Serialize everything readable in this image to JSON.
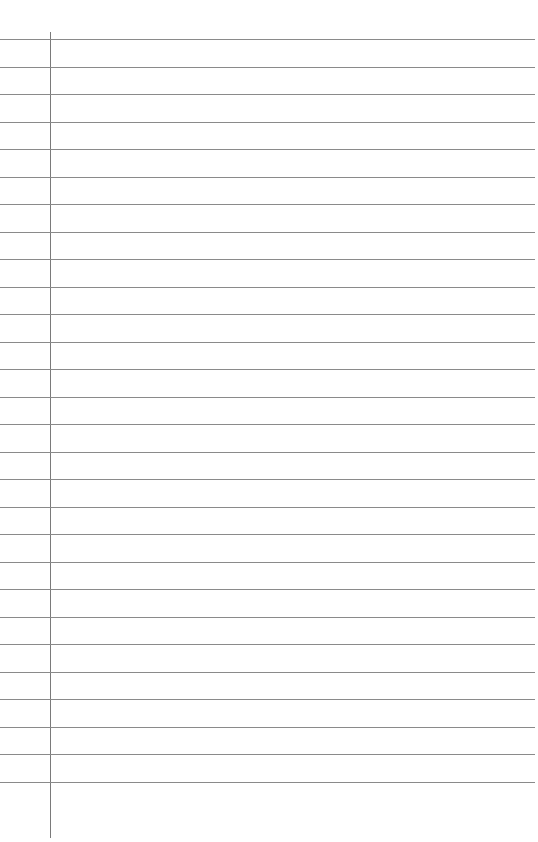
{
  "page": {
    "type": "lined-paper",
    "background_color": "#ffffff",
    "rule_color": "#8a8a8a",
    "margin_color": "#7a7a7a",
    "rule_count": 28,
    "first_rule_y": 39,
    "rule_spacing": 27.5,
    "margin_x": 50
  }
}
